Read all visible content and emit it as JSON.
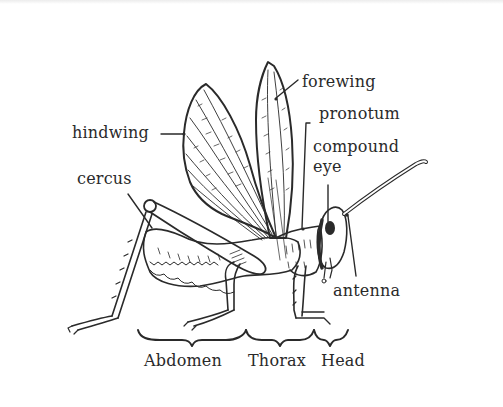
{
  "diagram": {
    "labels": {
      "forewing": "forewing",
      "pronotum": "pronotum",
      "hindwing": "hindwing",
      "compound_eye_line1": "compound",
      "compound_eye_line2": "eye",
      "cercus": "cercus",
      "antenna": "antenna"
    },
    "regions": {
      "abdomen": "Abdomen",
      "thorax": "Thorax",
      "head": "Head"
    },
    "colors": {
      "ink": "#2a2a2a",
      "background": "#ffffff"
    }
  }
}
